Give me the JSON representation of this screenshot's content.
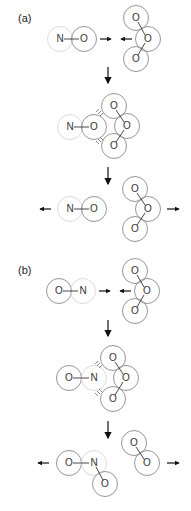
{
  "panels": [
    {
      "label": "(a)",
      "stages": [
        {
          "name": "reactants",
          "no": {
            "first": "N",
            "second": "O"
          },
          "o3": [
            "O",
            "O",
            "O"
          ]
        },
        {
          "name": "collision complex",
          "no": {
            "first": "N",
            "second": "O"
          },
          "o3": [
            "O",
            "O",
            "O"
          ]
        },
        {
          "name": "products",
          "no": {
            "first": "N",
            "second": "O"
          },
          "o3": [
            "O",
            "O",
            "O"
          ]
        }
      ]
    },
    {
      "label": "(b)",
      "stages": [
        {
          "name": "reactants",
          "no": {
            "first": "O",
            "second": "N"
          },
          "o3": [
            "O",
            "O",
            "O"
          ]
        },
        {
          "name": "collision complex",
          "no": {
            "first": "O",
            "second": "N"
          },
          "o3": [
            "O",
            "O",
            "O"
          ]
        },
        {
          "name": "products",
          "no2": [
            "O",
            "N",
            "O"
          ],
          "o2": [
            "O",
            "O"
          ]
        }
      ]
    }
  ],
  "colors": {
    "oxygen_ring": "#8a8a8a",
    "nitrogen_ring": "#d6d6d6",
    "arrow": "#111111",
    "text": "#333333"
  }
}
